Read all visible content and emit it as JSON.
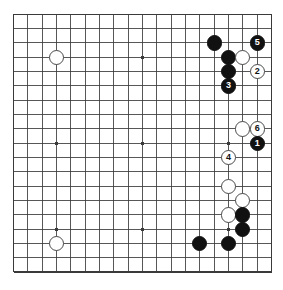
{
  "diagram": {
    "kind": "go-board-diagram",
    "board_size": 19,
    "background_color": "#ffffff",
    "line_color": "#3a3a3a",
    "border_color": "#3a3a3a",
    "black_color": "#111111",
    "white_color": "#ffffff",
    "white_outline_color": "#4a4a4a",
    "geometry": {
      "origin_x": 13.6,
      "origin_y": 14.3,
      "spacing": 14.33,
      "stone_diameter": 15.2,
      "star_dot_size": 3.2
    },
    "star_points": [
      {
        "col": 3,
        "row": 3
      },
      {
        "col": 9,
        "row": 3
      },
      {
        "col": 15,
        "row": 3
      },
      {
        "col": 3,
        "row": 9
      },
      {
        "col": 9,
        "row": 9
      },
      {
        "col": 15,
        "row": 9
      },
      {
        "col": 3,
        "row": 15
      },
      {
        "col": 9,
        "row": 15
      },
      {
        "col": 15,
        "row": 15
      }
    ],
    "stones": [
      {
        "col": 3,
        "row": 3,
        "color": "white",
        "label": ""
      },
      {
        "col": 3,
        "row": 16,
        "color": "white",
        "label": ""
      },
      {
        "col": 14,
        "row": 2,
        "color": "black",
        "label": ""
      },
      {
        "col": 15,
        "row": 3,
        "color": "black",
        "label": ""
      },
      {
        "col": 15,
        "row": 4,
        "color": "black",
        "label": ""
      },
      {
        "col": 16,
        "row": 3,
        "color": "white",
        "label": ""
      },
      {
        "col": 17,
        "row": 2,
        "color": "black",
        "label": "5"
      },
      {
        "col": 17,
        "row": 4,
        "color": "white",
        "label": "2"
      },
      {
        "col": 15,
        "row": 5,
        "color": "black",
        "label": "3"
      },
      {
        "col": 16,
        "row": 8,
        "color": "white",
        "label": ""
      },
      {
        "col": 17,
        "row": 8,
        "color": "white",
        "label": "6"
      },
      {
        "col": 17,
        "row": 9,
        "color": "black",
        "label": "1"
      },
      {
        "col": 15,
        "row": 10,
        "color": "white",
        "label": "4"
      },
      {
        "col": 15,
        "row": 12,
        "color": "white",
        "label": ""
      },
      {
        "col": 16,
        "row": 13,
        "color": "white",
        "label": ""
      },
      {
        "col": 15,
        "row": 14,
        "color": "white",
        "label": ""
      },
      {
        "col": 16,
        "row": 14,
        "color": "black",
        "label": ""
      },
      {
        "col": 16,
        "row": 15,
        "color": "black",
        "label": ""
      },
      {
        "col": 15,
        "row": 16,
        "color": "black",
        "label": ""
      },
      {
        "col": 13,
        "row": 16,
        "color": "black",
        "label": ""
      }
    ]
  }
}
